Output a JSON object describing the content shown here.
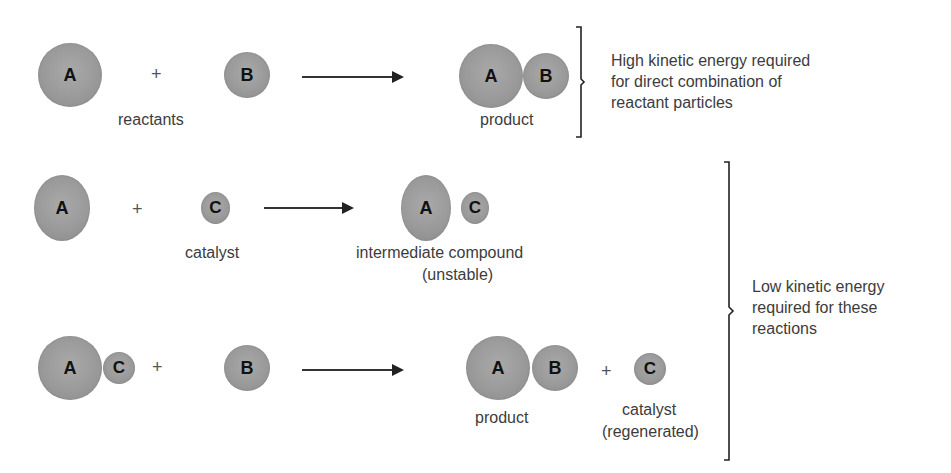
{
  "diagram": {
    "row1": {
      "reactant_a": "A",
      "plus": "+",
      "reactant_b": "B",
      "reactants_label": "reactants",
      "product_a": "A",
      "product_b": "B",
      "product_label": "product",
      "note": "High kinetic energy required for direct combination of reactant particles",
      "note_lines": [
        "High kinetic energy required",
        "for direct combination of",
        "reactant particles"
      ]
    },
    "row2": {
      "reactant_a": "A",
      "plus": "+",
      "catalyst_c": "C",
      "catalyst_label": "catalyst",
      "intermediate_a": "A",
      "intermediate_c": "C",
      "intermediate_label_1": "intermediate compound",
      "intermediate_label_2": "(unstable)"
    },
    "row3": {
      "complex_a": "A",
      "complex_c": "C",
      "plus1": "+",
      "reactant_b": "B",
      "product_a": "A",
      "product_b": "B",
      "plus2": "+",
      "catalyst_c": "C",
      "product_label": "product",
      "catalyst_label_1": "catalyst",
      "catalyst_label_2": "(regenerated)"
    },
    "low_energy_note_lines": [
      "Low kinetic energy",
      "required for these",
      "reactions"
    ],
    "colors": {
      "sphere": "#9c9c9c",
      "text": "#3c3c3c",
      "arrow": "#222222"
    }
  }
}
